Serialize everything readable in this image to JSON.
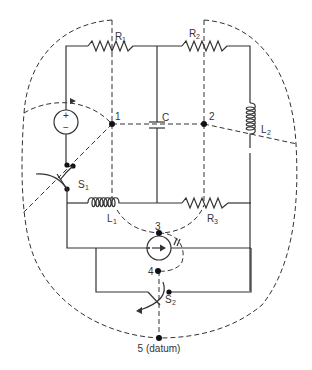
{
  "diagram": {
    "components": {
      "R1": {
        "name": "R",
        "sub": "1"
      },
      "R2": {
        "name": "R",
        "sub": "2"
      },
      "R3": {
        "name": "R",
        "sub": "3"
      },
      "L1": {
        "name": "L",
        "sub": "1"
      },
      "L2": {
        "name": "L",
        "sub": "2"
      },
      "C": {
        "name": "C"
      },
      "S1": {
        "name": "S",
        "sub": "1"
      },
      "S2": {
        "name": "S",
        "sub": "2"
      },
      "voltage_source": {
        "plus": "+",
        "minus": "−"
      },
      "current_source": {
        "direction": "right"
      }
    },
    "nodes": [
      {
        "id": "1",
        "label": "1"
      },
      {
        "id": "2",
        "label": "2"
      },
      {
        "id": "3",
        "label": "3"
      },
      {
        "id": "4",
        "label": "4"
      },
      {
        "id": "5",
        "label": "5 (datum)"
      }
    ],
    "colors": {
      "line": "#333333",
      "background": "#ffffff"
    }
  }
}
